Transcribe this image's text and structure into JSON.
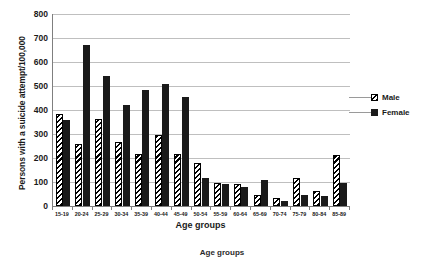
{
  "chart_data": {
    "type": "bar",
    "title": "",
    "xlabel": "Age groups",
    "ylabel": "Persons with a suicide attempt/100,000",
    "ylim": [
      0,
      800
    ],
    "ytick_step": 100,
    "yticks": [
      "800",
      "700",
      "600",
      "500",
      "400",
      "300",
      "200",
      "100",
      "0"
    ],
    "grid": true,
    "legend_position": "right",
    "categories": [
      "15-19",
      "20-24",
      "25-29",
      "30-34",
      "35-39",
      "40-44",
      "45-49",
      "50-54",
      "55-59",
      "60-64",
      "65-69",
      "70-74",
      "75-79",
      "80-84",
      "85-89"
    ],
    "series": [
      {
        "name": "Male",
        "style": "diagonal-hatch",
        "color": "#000000",
        "values": [
          383,
          258,
          363,
          265,
          215,
          297,
          215,
          178,
          95,
          92,
          45,
          35,
          115,
          62,
          212
        ]
      },
      {
        "name": "Female",
        "style": "solid",
        "color": "#1a1a1a",
        "values": [
          358,
          670,
          543,
          420,
          482,
          508,
          455,
          115,
          90,
          78,
          110,
          22,
          45,
          40,
          95
        ]
      }
    ]
  },
  "axes": {
    "y_title": "Persons with a suicide attempt/100,000",
    "x_title": "Age groups"
  },
  "legend": {
    "items": [
      {
        "label": "Male"
      },
      {
        "label": "Female"
      }
    ]
  },
  "caption": {
    "text": "Age groups"
  }
}
